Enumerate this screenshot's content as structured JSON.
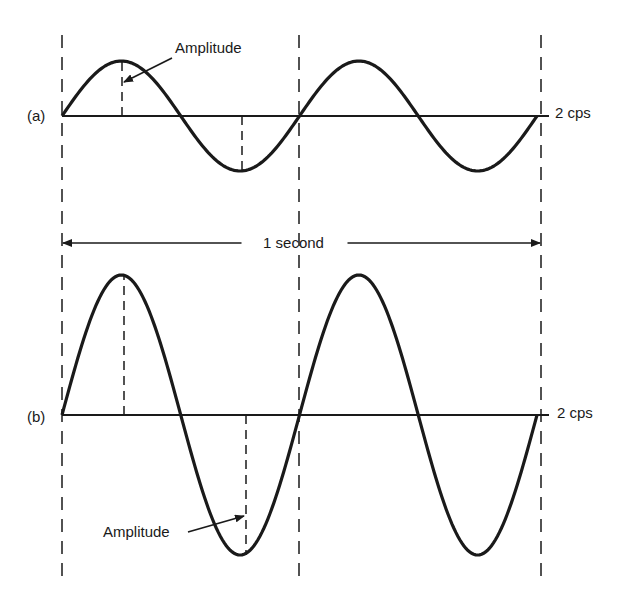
{
  "figure": {
    "colors": {
      "ink": "#1a1a1a",
      "background": "#ffffff"
    },
    "time_span": {
      "label": "1 second",
      "x_start": 62,
      "x_end": 541,
      "y": 243
    },
    "guides": {
      "x": [
        62,
        299,
        541
      ],
      "y_top": 35,
      "y_bottom": 578
    },
    "panels": [
      {
        "id": "a",
        "label": "(a)",
        "frequency_label": "2 cps",
        "cycles": 2,
        "baseline_y": 116,
        "amplitude_px": 55,
        "amplitude_label": "Amplitude",
        "amplitude_label_pos": {
          "x": 175,
          "y": 53
        },
        "amplitude_arrow": {
          "x1": 172,
          "y1": 58,
          "x2": 124,
          "y2": 82
        },
        "peak_marker_x": 122,
        "trough_marker_x": 242
      },
      {
        "id": "b",
        "label": "(b)",
        "frequency_label": "2 cps",
        "cycles": 2,
        "baseline_y": 415,
        "amplitude_px": 140,
        "amplitude_label": "Amplitude",
        "amplitude_label_pos": {
          "x": 103,
          "y": 537
        },
        "amplitude_arrow": {
          "x1": 188,
          "y1": 532,
          "x2": 244,
          "y2": 516
        },
        "peak_marker_x": 124,
        "trough_marker_x": 246
      }
    ]
  }
}
